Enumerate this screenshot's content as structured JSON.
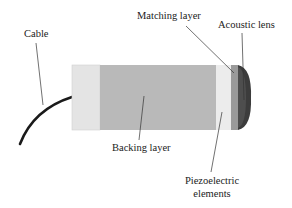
{
  "diagram": {
    "type": "ultrasound-transducer-cross-section",
    "labels": {
      "cable": "Cable",
      "matching_layer": "Matching layer",
      "acoustic_lens": "Acoustic lens",
      "backing_layer": "Backing layer",
      "piezo_line1": "Piezoelectric",
      "piezo_line2": "elements"
    },
    "colors": {
      "end_cap": "#e4e4e4",
      "backing_layer": "#b9b9b9",
      "piezoelectric": "#ececec",
      "matching_layer": "#9a9a9a",
      "acoustic_lens": "#3c3c3c",
      "cable": "#1a1a1a",
      "leader_line": "#333333"
    }
  }
}
